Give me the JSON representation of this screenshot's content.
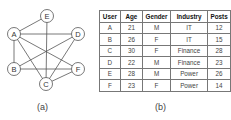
{
  "graph": {
    "caption": "(a)",
    "nodes": [
      {
        "id": "E",
        "x": 47,
        "y": 16
      },
      {
        "id": "A",
        "x": 14,
        "y": 34
      },
      {
        "id": "D",
        "x": 78,
        "y": 34
      },
      {
        "id": "B",
        "x": 14,
        "y": 69
      },
      {
        "id": "F",
        "x": 78,
        "y": 69
      },
      {
        "id": "C",
        "x": 46,
        "y": 84
      }
    ],
    "edges": [
      [
        "A",
        "E"
      ],
      [
        "A",
        "D"
      ],
      [
        "A",
        "B"
      ],
      [
        "A",
        "C"
      ],
      [
        "A",
        "F"
      ],
      [
        "E",
        "C"
      ],
      [
        "B",
        "D"
      ],
      [
        "B",
        "F"
      ],
      [
        "C",
        "D"
      ],
      [
        "C",
        "F"
      ]
    ]
  },
  "table": {
    "caption": "(b)",
    "headers": [
      "User",
      "Age",
      "Gender",
      "Industry",
      "Posts"
    ],
    "rows": [
      [
        "A",
        "21",
        "M",
        "IT",
        "12"
      ],
      [
        "B",
        "26",
        "F",
        "IT",
        "15"
      ],
      [
        "C",
        "30",
        "F",
        "Finance",
        "28"
      ],
      [
        "D",
        "22",
        "M",
        "Finance",
        "23"
      ],
      [
        "E",
        "28",
        "M",
        "Power",
        "26"
      ],
      [
        "F",
        "23",
        "F",
        "Power",
        "14"
      ]
    ]
  }
}
